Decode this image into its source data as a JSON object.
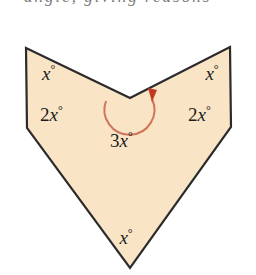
{
  "figure": {
    "title_fragment": "angle, giving reasons",
    "background_color": "#ffffff",
    "fill_color": "#f9e5c6",
    "stroke_color": "#2b2b2b",
    "arc_color": "#d1755a",
    "arrow_color": "#c03a22",
    "polygon_points": "26,48 130,98 230,47 231,127 130,268 27,128",
    "labels": {
      "top_left": "x",
      "top_right": "x",
      "mid_left": "2x",
      "mid_right": "2x",
      "reflex": "3x",
      "bottom": "x",
      "degree_symbol": "°",
      "coef_two": "2",
      "coef_three": "3"
    },
    "reflex_arc": {
      "path": "M 106,101 A 25,25 0 1 0 152,99",
      "arrowhead": "148,88 157,90 152,102"
    }
  }
}
